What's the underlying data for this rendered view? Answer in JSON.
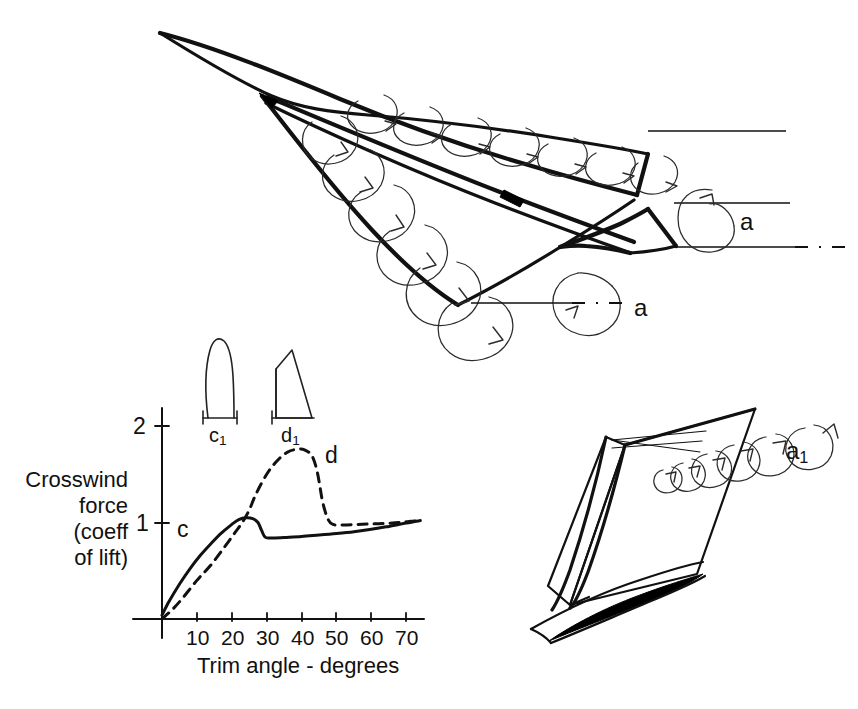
{
  "figure": {
    "background_color": "#ffffff",
    "ink_color": "#111111"
  },
  "chart_data": {
    "type": "line",
    "title": "",
    "xlabel": "Trim angle - degrees",
    "ylabel": "Crosswind force (coeff of lift)",
    "ylabel_lines": [
      "Crosswind",
      "force",
      "(coeff",
      "of lift)"
    ],
    "xlim": [
      0,
      75
    ],
    "ylim": [
      0,
      2.2
    ],
    "xticks": [
      10,
      20,
      30,
      40,
      50,
      60,
      70
    ],
    "xtick_labels": [
      "10",
      "20",
      "30",
      "40",
      "50",
      "60",
      "70"
    ],
    "yticks": [
      1,
      2
    ],
    "ytick_labels": [
      "1",
      "2"
    ],
    "grid": false,
    "legend": "inline-labels",
    "series": [
      {
        "name": "c",
        "label": "c",
        "style": "solid",
        "x": [
          0,
          2,
          5,
          8,
          11,
          14,
          17,
          20,
          22,
          24,
          26,
          27.5,
          28.5,
          29.5,
          31,
          35,
          40,
          45,
          50,
          55,
          60,
          65,
          70,
          74
        ],
        "values": [
          0.04,
          0.18,
          0.36,
          0.52,
          0.66,
          0.78,
          0.89,
          0.98,
          1.03,
          1.05,
          1.04,
          1.0,
          0.92,
          0.85,
          0.84,
          0.845,
          0.855,
          0.87,
          0.885,
          0.905,
          0.93,
          0.96,
          0.995,
          1.02
        ]
      },
      {
        "name": "d",
        "label": "d",
        "style": "dashed",
        "x": [
          0,
          3,
          6,
          10,
          14,
          18,
          21,
          23,
          25,
          27,
          30,
          33,
          36,
          39,
          41,
          43,
          44.5,
          46,
          47.5,
          49,
          52,
          56,
          60,
          64,
          68,
          72,
          74
        ],
        "values": [
          0.0,
          0.1,
          0.22,
          0.4,
          0.56,
          0.75,
          0.9,
          1.0,
          1.13,
          1.3,
          1.5,
          1.64,
          1.73,
          1.76,
          1.75,
          1.69,
          1.52,
          1.22,
          1.04,
          0.98,
          0.975,
          0.98,
          0.985,
          0.99,
          1.0,
          1.015,
          1.02
        ]
      }
    ],
    "annotations": [
      {
        "name": "curve-label-c",
        "text": "c",
        "x": 6,
        "y": 0.92
      },
      {
        "name": "curve-label-d",
        "text": "d",
        "x": 45,
        "y": 1.78
      }
    ]
  },
  "insets": [
    {
      "name": "planform-c1",
      "label": "c",
      "label_sub": "1",
      "shape": "rounded-tip narrow sail planform"
    },
    {
      "name": "planform-d1",
      "label": "d",
      "label_sub": "1",
      "shape": "triangular delta sail planform"
    }
  ],
  "diagrams": {
    "top": {
      "name": "delta-sail-vortex-top-view",
      "description": "Delta wing sail in plan with leading-edge vortex spirals",
      "vortex_labels": [
        {
          "name": "vortex-label-a-upper",
          "text": "a"
        },
        {
          "name": "vortex-label-a-lower",
          "text": "a"
        }
      ]
    },
    "right": {
      "name": "sail-vortex-perspective",
      "description": "Perspective view of sail with trailing vortex spiral",
      "vortex_labels": [
        {
          "name": "vortex-label-a1",
          "text": "a",
          "sub": "1"
        }
      ]
    }
  }
}
